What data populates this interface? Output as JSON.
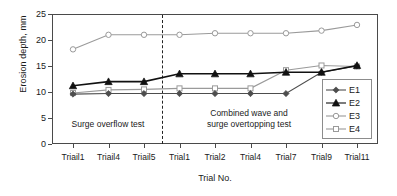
{
  "chart_data": {
    "type": "line",
    "title": "",
    "xlabel": "Trial No.",
    "ylabel": "Erosion depth, mm",
    "ylim": [
      0,
      25
    ],
    "yticks": [
      0,
      5,
      10,
      15,
      20,
      25
    ],
    "grid": false,
    "legend_position": "right-inside",
    "categories": [
      "Triail1",
      "Triail4",
      "Triail5",
      "Trial1",
      "Trial2",
      "Trial4",
      "Trial7",
      "Trial9",
      "Trial11"
    ],
    "series": [
      {
        "name": "E1",
        "marker": "filled-diamond",
        "color": "#4d4d4d",
        "values": [
          9.6,
          9.7,
          9.7,
          9.7,
          9.7,
          9.7,
          9.7,
          13.8,
          15.0
        ]
      },
      {
        "name": "E2",
        "marker": "filled-triangle",
        "color": "#111111",
        "values": [
          11.2,
          12.0,
          12.0,
          13.5,
          13.5,
          13.5,
          13.8,
          13.8,
          15.1
        ]
      },
      {
        "name": "E3",
        "marker": "open-circle",
        "color": "#9a9a9a",
        "values": [
          18.2,
          21.0,
          21.0,
          21.0,
          21.3,
          21.3,
          21.3,
          21.8,
          22.9
        ]
      },
      {
        "name": "E4",
        "marker": "open-square",
        "color": "#9a9a9a",
        "values": [
          9.8,
          10.4,
          10.5,
          10.7,
          10.7,
          10.7,
          14.2,
          15.1,
          14.9
        ]
      }
    ],
    "annotations": [
      {
        "text": "Surge overflow test",
        "lines": [
          "Surge overflow test"
        ]
      },
      {
        "text": "Combined wave and surge overtopping test",
        "lines": [
          "Combined wave and",
          "surge overtopping test"
        ]
      }
    ],
    "divider": {
      "after_category_index": 2,
      "style": "dashed"
    },
    "legend": [
      "E1",
      "E2",
      "E3",
      "E4"
    ]
  }
}
